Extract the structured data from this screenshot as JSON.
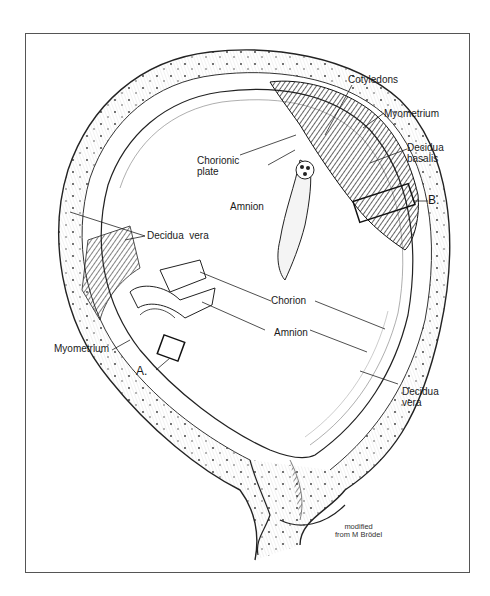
{
  "figure": {
    "type": "anatomical-illustration",
    "credit": [
      "modified",
      "from M Brödel"
    ]
  },
  "labels": {
    "cotyledons": "Cotyledons",
    "myometrium_top": "Myometrium",
    "decidua_basalis": [
      "Decidua",
      "basalis"
    ],
    "chorionic_plate": [
      "Chorionic",
      "plate"
    ],
    "amnion_top": "Amnion",
    "box_b": "B.",
    "decidua_vera_left": "Decidua  vera",
    "chorion": "Chorion",
    "amnion_mid": "Amnion",
    "myometrium_left": "Myometrium",
    "box_a": "A.",
    "decidua_vera_right": [
      "Decidua",
      "vera"
    ]
  },
  "colors": {
    "ink": "#1a1a1a",
    "frame": "#555555",
    "background": "#ffffff"
  }
}
